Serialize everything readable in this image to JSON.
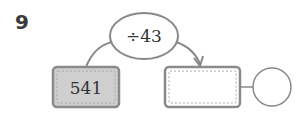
{
  "problem": {
    "number": "9"
  },
  "diagram": {
    "operation": "÷43",
    "input_value": "541",
    "output_value": "",
    "remainder_value": ""
  },
  "colors": {
    "stroke": "#888888",
    "input_fill": "#cfcfcf",
    "output_fill": "#ffffff",
    "text": "#333333"
  }
}
